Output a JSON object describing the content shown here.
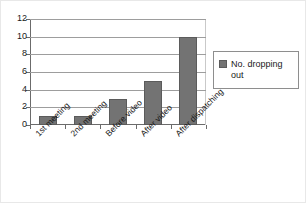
{
  "chart_data": {
    "type": "bar",
    "title": "",
    "xlabel": "",
    "ylabel": "",
    "categories": [
      "1st meeting",
      "2nd meeting",
      "Before video",
      "After video",
      "After dispatching"
    ],
    "values": [
      1,
      1,
      3,
      5,
      10
    ],
    "series": [
      {
        "name": "No. dropping out",
        "values": [
          1,
          1,
          3,
          5,
          10
        ],
        "color": "#737373"
      }
    ],
    "ylim": [
      0,
      12
    ],
    "ytick_step": 2,
    "yticks": [
      0,
      2,
      4,
      6,
      8,
      10,
      12
    ],
    "ytick_labels": [
      "0",
      "2",
      "4",
      "6",
      "8",
      "10",
      "12"
    ],
    "grid": true,
    "grid_axis": "y",
    "legend_position": "right",
    "legend_entries": [
      "No. dropping out"
    ],
    "background_color": "#ffffff",
    "axis_color": "#6b6b6b",
    "grid_color": "#9d9d9d"
  },
  "legend": {
    "label": "No. dropping out",
    "swatch_name": "legend-color-swatch"
  },
  "axis": {
    "y_labels": [
      "12",
      "10",
      "8",
      "6",
      "4",
      "2",
      "0"
    ]
  }
}
